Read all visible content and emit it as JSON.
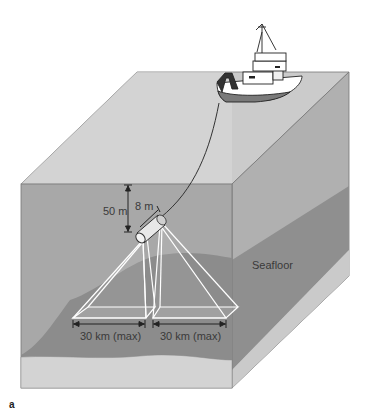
{
  "figure": {
    "panel_label": "a",
    "labels": {
      "depth": "50 m",
      "length": "8 m",
      "seafloor": "Seafloor",
      "swath_left": "30 km (max)",
      "swath_right": "30 km (max)"
    },
    "elements": [
      "survey-ship",
      "tow-cable",
      "side-scan-sonar-towfish",
      "sonar-beams",
      "seafloor",
      "sediment-layer",
      "water-block"
    ],
    "colors": {
      "water_front": "#a9a9a9",
      "water_top": "#cfcfcf",
      "water_right": "#b4b4b4",
      "seafloor": "#8e8e8e",
      "sediment": "#d2d2d2",
      "beam": "#ffffff",
      "text": "#3a3a3a"
    }
  }
}
